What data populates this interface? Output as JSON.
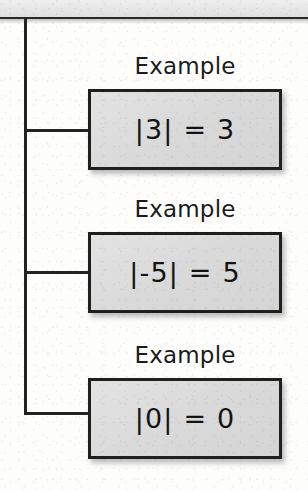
{
  "diagram": {
    "type": "tree-flowchart",
    "topic": "absolute-value-examples",
    "colors": {
      "page_background": "#fdfdfc",
      "top_band": "#e6e6e6",
      "line": "#232323",
      "box_fill": "#dadada",
      "box_border": "#1f1f1f",
      "text": "#131313"
    },
    "trunk": {
      "x": 24,
      "top": 17,
      "bottom": 415
    },
    "branches": [
      {
        "y": 129
      },
      {
        "y": 271
      },
      {
        "y": 412
      }
    ],
    "nodes": [
      {
        "label": "Example",
        "equation": "|3| = 3",
        "label_top": 53,
        "box_top": 89,
        "box_height": 81
      },
      {
        "label": "Example",
        "equation": "|-5| = 5",
        "label_top": 196,
        "box_top": 232,
        "box_height": 81
      },
      {
        "label": "Example",
        "equation": "|0| = 0",
        "label_top": 342,
        "box_top": 378,
        "box_height": 81
      }
    ]
  }
}
